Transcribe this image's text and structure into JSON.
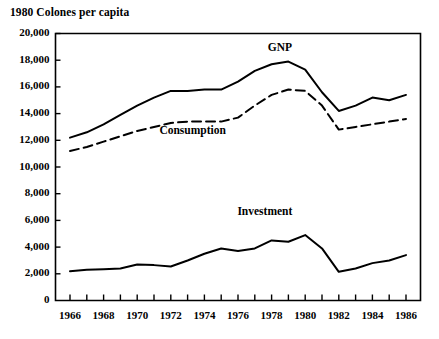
{
  "chart_data": {
    "type": "line",
    "title": "1980 Colones per capita",
    "xlabel": "",
    "ylabel": "",
    "xlim": [
      1966,
      1986
    ],
    "ylim": [
      0,
      20000
    ],
    "ytick_step": 2000,
    "xtick_step": 1,
    "xlabel_step": 2,
    "grid": false,
    "legend": "inline-annotations",
    "yticks": [
      "0",
      "2,000",
      "4,000",
      "6,000",
      "8,000",
      "10,000",
      "12,000",
      "14,000",
      "16,000",
      "18,000",
      "20,000"
    ],
    "ytick_values": [
      0,
      2000,
      4000,
      6000,
      8000,
      10000,
      12000,
      14000,
      16000,
      18000,
      20000
    ],
    "xticks": [
      "1966",
      "1968",
      "1970",
      "1972",
      "1974",
      "1976",
      "1978",
      "1980",
      "1982",
      "1984",
      "1986"
    ],
    "xtick_values": [
      1966,
      1968,
      1970,
      1972,
      1974,
      1976,
      1978,
      1980,
      1982,
      1984,
      1986
    ],
    "x": [
      1966,
      1967,
      1968,
      1969,
      1970,
      1971,
      1972,
      1973,
      1974,
      1975,
      1976,
      1977,
      1978,
      1979,
      1980,
      1981,
      1982,
      1983,
      1984,
      1985,
      1986
    ],
    "series": [
      {
        "name": "GNP",
        "style": "solid",
        "color": "#000000",
        "values": [
          12200,
          12600,
          13200,
          13900,
          14600,
          15200,
          15700,
          15700,
          15800,
          15800,
          16400,
          17200,
          17700,
          17900,
          17300,
          15600,
          14200,
          14600,
          15200,
          15000,
          15400
        ]
      },
      {
        "name": "Consumption",
        "style": "dashed",
        "color": "#000000",
        "values": [
          11200,
          11500,
          11900,
          12300,
          12700,
          13000,
          13300,
          13400,
          13400,
          13400,
          13700,
          14600,
          15400,
          15800,
          15700,
          14600,
          12800,
          13000,
          13200,
          13400,
          13600
        ]
      },
      {
        "name": "Investment",
        "style": "solid",
        "color": "#000000",
        "values": [
          2200,
          2300,
          2350,
          2400,
          2700,
          2650,
          2550,
          3000,
          3500,
          3900,
          3700,
          3900,
          4500,
          4400,
          4900,
          3900,
          2150,
          2400,
          2800,
          3000,
          3400
        ]
      }
    ],
    "annotations": [
      {
        "text": "GNP",
        "x": 1978.5,
        "y": 18900
      },
      {
        "text": "Consumption",
        "x": 1973.3,
        "y": 12700
      },
      {
        "text": "Investment",
        "x": 1977.6,
        "y": 6600
      }
    ]
  }
}
